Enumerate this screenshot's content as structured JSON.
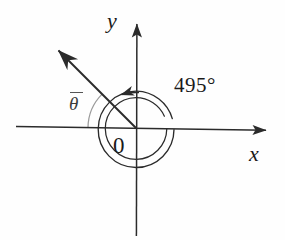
{
  "figure": {
    "type": "coterminal-angle-diagram",
    "background_color": "#fefefe",
    "ink_color": "#2b2b2b",
    "light_ink_color": "#8a8a8a",
    "width": 285,
    "height": 240,
    "origin": {
      "x": 136,
      "y": 128
    },
    "labels": {
      "y_axis": "y",
      "x_axis": "x",
      "origin": "0",
      "angle_measure": "495°",
      "reference_angle": "θ"
    },
    "axes": {
      "x_axis": {
        "x1": 16,
        "y1": 126.5,
        "x2": 272,
        "y2": 130.5,
        "arrow_at": "positive-x"
      },
      "y_axis": {
        "x1": 136.5,
        "y1": 236,
        "x2": 137,
        "y2": 16,
        "arrow_at": "positive-y"
      }
    },
    "terminal_ray": {
      "from": {
        "x": 136,
        "y": 128
      },
      "to": {
        "x": 53,
        "y": 45
      },
      "direction_degrees": 135,
      "arrow_at": "terminal-end"
    },
    "rotation_spiral": {
      "description": "two nested arcs spiralling counterclockwise from positive x-axis through 495 degrees",
      "outer_radius": 38,
      "inner_radius": 31,
      "sweep_degrees": 495,
      "arrow_at": "spiral-end",
      "arrow_tip": {
        "x": 117,
        "y": 94
      }
    },
    "reference_angle_arc": {
      "radius": 48,
      "start_degrees": 180,
      "end_degrees": 135,
      "color": "#8f8f8f"
    }
  }
}
